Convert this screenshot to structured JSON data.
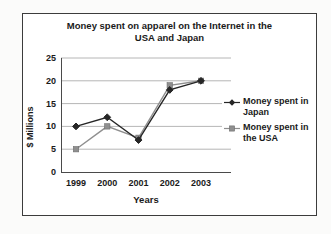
{
  "colors": {
    "frame_border": "#3c3c3c",
    "background": "#ffffff",
    "gridline": "#9e9e9e",
    "axis": "#4a4a4a",
    "text": "#1a1a1a"
  },
  "chart_data": {
    "type": "line",
    "title": "Money spent on apparel on the Internet in the USA and Japan",
    "title_lines": [
      "Money spent on apparel on the Internet in the",
      "USA and Japan"
    ],
    "xlabel": "Years",
    "ylabel": "$ Millions",
    "categories": [
      "1999",
      "2000",
      "2001",
      "2002",
      "2003"
    ],
    "yticks": [
      0,
      5,
      10,
      15,
      20,
      25
    ],
    "ylim": [
      0,
      25
    ],
    "grid": true,
    "legend_position": "right",
    "series": [
      {
        "name": "Money spent in Japan",
        "values": [
          10,
          12,
          7,
          18,
          20
        ],
        "color": "#262626",
        "marker": "diamond"
      },
      {
        "name": "Money spent in the USA",
        "values": [
          5,
          10,
          7.5,
          19,
          20
        ],
        "color": "#8f8f8f",
        "marker": "square"
      }
    ]
  }
}
